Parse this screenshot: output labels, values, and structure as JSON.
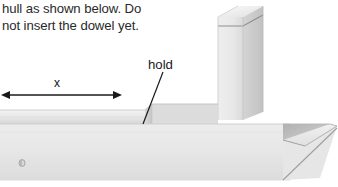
{
  "figure": {
    "name": "boat-hull-assembly-diagram",
    "background_color": "#ffffff",
    "instruction_text": "hull as shown below. Do\nnot insert the dowel yet.",
    "instruction_lines": [
      "hull as shown below. Do",
      "not insert the dowel yet."
    ],
    "annotations": {
      "hold_label": "hold",
      "dimension_label": "x"
    },
    "colors": {
      "wood_light": "#f0f0f0",
      "wood_mid": "#e3e3e3",
      "wood_shade": "#d2d2d2",
      "wood_dark": "#b9b9b9",
      "wood_darkest": "#9a9a9a",
      "outline": "#c9c9c9",
      "arrow": "#1a1a1a",
      "text": "#2a2a2a",
      "leader_line": "#1a1a1a"
    },
    "parts": [
      {
        "name": "hull-body",
        "label": "hull"
      },
      {
        "name": "hold-block",
        "label": "hold"
      },
      {
        "name": "superstructure-block",
        "label": "vertical block"
      },
      {
        "name": "bow-point",
        "label": "bow"
      },
      {
        "name": "top-rail-strip",
        "label": "rail"
      },
      {
        "name": "wood-knot-dot",
        "label": "knot"
      }
    ],
    "dimension": {
      "name": "x-dimension",
      "label": "x",
      "arrow_style": "double-headed",
      "x_start": 10,
      "x_end": 113,
      "y": 95
    },
    "leader": {
      "name": "hold-leader-line",
      "x_start": 163,
      "y_start": 72,
      "x_end": 143,
      "y_end": 124
    }
  }
}
